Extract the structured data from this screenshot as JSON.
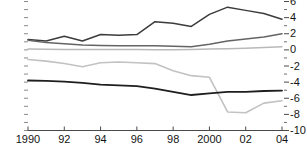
{
  "chart_data": {
    "type": "line",
    "title": "",
    "subtitle": "",
    "xlabel": "",
    "ylabel": "",
    "x": [
      1990,
      1991,
      1992,
      1993,
      1994,
      1995,
      1996,
      1997,
      1998,
      1999,
      2000,
      2001,
      2002,
      2003,
      2004
    ],
    "x_tick_values": [
      1990,
      1992,
      1994,
      1996,
      1998,
      2000,
      2002,
      2004
    ],
    "x_tick_labels": [
      "1990",
      "92",
      "94",
      "96",
      "98",
      "2000",
      "02",
      "04"
    ],
    "xlim": [
      1990,
      2004
    ],
    "ylim": [
      -10,
      6
    ],
    "y_tick_values": [
      6,
      4,
      2,
      0,
      -2,
      -4,
      -6,
      -8,
      -10
    ],
    "y_tick_labels": [
      "6",
      "4",
      "2",
      "0",
      "-2",
      "-4",
      "-6",
      "-8",
      "-10"
    ],
    "y_axis_position": "right",
    "y_minor_ticks": true,
    "grid": false,
    "legend": "none",
    "series": [
      {
        "name": "series-1",
        "color": "#3c3c3c",
        "width": 1.5,
        "values": [
          1.3,
          1.1,
          1.7,
          1.1,
          1.9,
          1.8,
          1.9,
          3.5,
          3.3,
          2.9,
          4.4,
          5.3,
          4.9,
          4.5,
          3.8
        ]
      },
      {
        "name": "series-2",
        "color": "#646464",
        "width": 1.5,
        "values": [
          1.2,
          0.9,
          0.75,
          0.6,
          0.55,
          0.5,
          0.5,
          0.5,
          0.45,
          0.4,
          0.7,
          1.1,
          1.35,
          1.6,
          2.0
        ]
      },
      {
        "name": "series-3",
        "color": "#b9b9b9",
        "width": 1.5,
        "values": [
          0.1,
          0.08,
          0.06,
          0.05,
          0.05,
          0.04,
          0.04,
          0.03,
          0.03,
          0.05,
          0.1,
          0.15,
          0.2,
          0.3,
          0.4
        ]
      },
      {
        "name": "series-4",
        "color": "#c2c2c2",
        "width": 1.6,
        "values": [
          -1.2,
          -1.4,
          -1.7,
          -2.1,
          -1.6,
          -1.5,
          -1.6,
          -1.7,
          -2.6,
          -3.2,
          -3.4,
          -7.7,
          -7.8,
          -6.6,
          -6.3
        ]
      },
      {
        "name": "series-5",
        "color": "#1e1e1e",
        "width": 1.8,
        "values": [
          -3.8,
          -3.85,
          -3.95,
          -4.1,
          -4.3,
          -4.4,
          -4.5,
          -4.8,
          -5.2,
          -5.6,
          -5.4,
          -5.2,
          -5.2,
          -5.1,
          -5.05
        ]
      }
    ]
  }
}
